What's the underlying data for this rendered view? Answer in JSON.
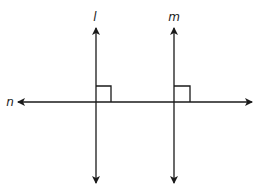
{
  "diagram": {
    "title": "",
    "stroke_color": "#1a1a1a",
    "background": "#ffffff",
    "lines": [
      {
        "id": "l",
        "label": "l",
        "orientation": "vertical",
        "x": 96,
        "y1": 28,
        "y2": 183,
        "arrows": "both",
        "label_pos": [
          95,
          21
        ]
      },
      {
        "id": "m",
        "label": "m",
        "orientation": "vertical",
        "x": 174,
        "y1": 28,
        "y2": 183,
        "arrows": "both",
        "label_pos": [
          173,
          21
        ]
      },
      {
        "id": "n",
        "label": "n",
        "orientation": "horizontal",
        "y": 102,
        "x1": 18,
        "x2": 252,
        "arrows": "both",
        "label_pos": [
          10,
          106
        ]
      }
    ],
    "right_angle_marks": [
      {
        "at": "l-n intersection",
        "x": 96,
        "y": 102,
        "size": 15
      },
      {
        "at": "m-n intersection",
        "x": 174,
        "y": 102,
        "size": 15
      }
    ],
    "labels": {
      "l": "l",
      "m": "m",
      "n": "n"
    }
  }
}
